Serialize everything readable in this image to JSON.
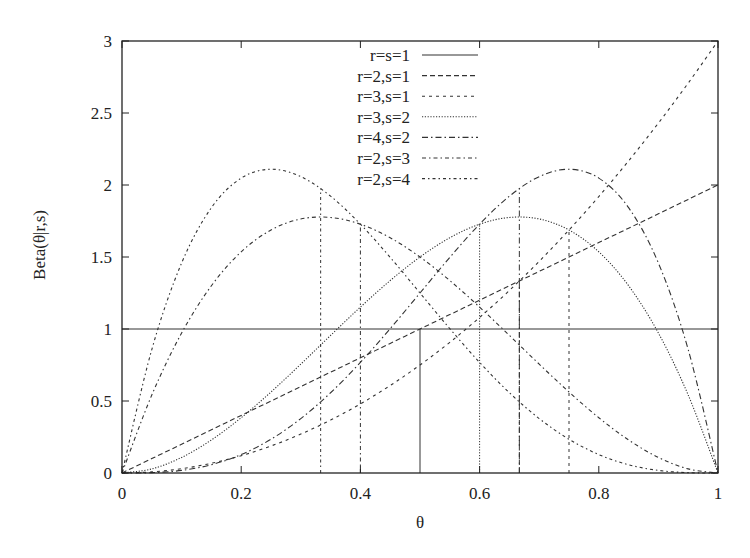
{
  "chart_data": {
    "type": "line",
    "title": "",
    "xlabel": "θ",
    "ylabel": "Beta(θ|r,s)",
    "xlim": [
      0,
      1
    ],
    "ylim": [
      0,
      3
    ],
    "grid": false,
    "legend_position": "top-center",
    "x_ticks": [
      "0",
      "0.2",
      "0.4",
      "0.6",
      "0.8",
      "1"
    ],
    "y_ticks": [
      "0",
      "0.5",
      "1",
      "1.5",
      "2",
      "2.5",
      "3"
    ],
    "x": [
      0,
      0.05,
      0.1,
      0.15,
      0.2,
      0.25,
      0.3,
      0.35,
      0.4,
      0.45,
      0.5,
      0.55,
      0.6,
      0.65,
      0.7,
      0.75,
      0.8,
      0.85,
      0.9,
      0.95,
      1
    ],
    "series": [
      {
        "name": "r=s=1",
        "dash": "solid",
        "values": [
          1,
          1,
          1,
          1,
          1,
          1,
          1,
          1,
          1,
          1,
          1,
          1,
          1,
          1,
          1,
          1,
          1,
          1,
          1,
          1,
          1
        ],
        "mean": 0.5,
        "mean_height": 1.0
      },
      {
        "name": "r=2,s=1",
        "dash": "dashed",
        "values": [
          0,
          0.1,
          0.2,
          0.3,
          0.4,
          0.5,
          0.6,
          0.7,
          0.8,
          0.9,
          1.0,
          1.1,
          1.2,
          1.3,
          1.4,
          1.5,
          1.6,
          1.7,
          1.8,
          1.9,
          2.0
        ],
        "mean": 0.6667,
        "mean_height": 1.3333
      },
      {
        "name": "r=3,s=1",
        "dash": "short-dashed",
        "values": [
          0,
          0.0075,
          0.03,
          0.0675,
          0.12,
          0.1875,
          0.27,
          0.3675,
          0.48,
          0.6075,
          0.75,
          0.9075,
          1.08,
          1.2675,
          1.47,
          1.6875,
          1.92,
          2.1675,
          2.43,
          2.7075,
          3.0
        ],
        "mean": 0.75,
        "mean_height": 1.6875
      },
      {
        "name": "r=3,s=2",
        "dash": "dotted",
        "values": [
          0,
          0.0285,
          0.108,
          0.2295,
          0.384,
          0.5625,
          0.756,
          0.9555,
          1.152,
          1.3365,
          1.5,
          1.6335,
          1.728,
          1.7745,
          1.764,
          1.6875,
          1.536,
          1.3005,
          0.972,
          0.5415,
          0
        ],
        "mean": 0.6,
        "mean_height": 1.728
      },
      {
        "name": "r=4,s=2",
        "dash": "dash-dot",
        "values": [
          0,
          0.0024,
          0.018,
          0.0574,
          0.128,
          0.2344,
          0.378,
          0.5574,
          0.768,
          1.0024,
          1.25,
          1.4974,
          1.728,
          1.9224,
          2.058,
          2.1094,
          2.048,
          1.8424,
          1.458,
          0.8574,
          0
        ],
        "mean": 0.6667,
        "mean_height": 1.9753
      },
      {
        "name": "r=2,s=3",
        "dash": "dash-dot-short",
        "values": [
          0,
          0.5415,
          0.972,
          1.3005,
          1.536,
          1.6875,
          1.764,
          1.7745,
          1.728,
          1.6335,
          1.5,
          1.3365,
          1.152,
          0.9555,
          0.756,
          0.5625,
          0.384,
          0.2295,
          0.108,
          0.0285,
          0
        ],
        "mean": 0.4,
        "mean_height": 1.728
      },
      {
        "name": "r=2,s=4",
        "dash": "dash-dot-dot",
        "values": [
          0,
          0.8574,
          1.458,
          1.8424,
          2.048,
          2.1094,
          2.058,
          1.9224,
          1.728,
          1.4974,
          1.25,
          1.0024,
          0.768,
          0.5574,
          0.378,
          0.2344,
          0.128,
          0.0574,
          0.018,
          0.0024,
          0
        ],
        "mean": 0.3333,
        "mean_height": 1.9753
      }
    ]
  },
  "styles": {
    "line_color": "#333333",
    "axis_color": "#222222"
  }
}
